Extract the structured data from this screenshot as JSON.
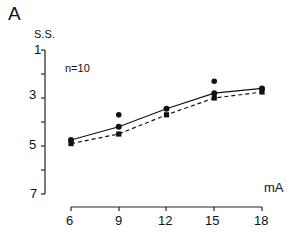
{
  "panel_label": "A",
  "annotation": "n=10",
  "chart_data": {
    "type": "line",
    "title": "",
    "panel": "A",
    "xlabel": "mA",
    "ylabel": "S.S.",
    "x": [
      6,
      9,
      12,
      15,
      18
    ],
    "xticks": [
      "6",
      "9",
      "12",
      "15",
      "18"
    ],
    "yticks": [
      "1",
      "3",
      "5",
      "7"
    ],
    "ylim": [
      1,
      7
    ],
    "y_inverted": true,
    "grid": false,
    "series": [
      {
        "name": "solid",
        "style": "solid",
        "marker": "circle",
        "values": [
          4.75,
          4.2,
          3.45,
          2.8,
          2.6
        ]
      },
      {
        "name": "dashed",
        "style": "dashed",
        "marker": "square",
        "values": [
          4.9,
          4.5,
          3.7,
          3.0,
          2.75
        ]
      }
    ],
    "significance_markers": [
      {
        "x": 9,
        "label": "*"
      },
      {
        "x": 15,
        "label": "*"
      }
    ],
    "annotations": [
      "n=10"
    ]
  }
}
